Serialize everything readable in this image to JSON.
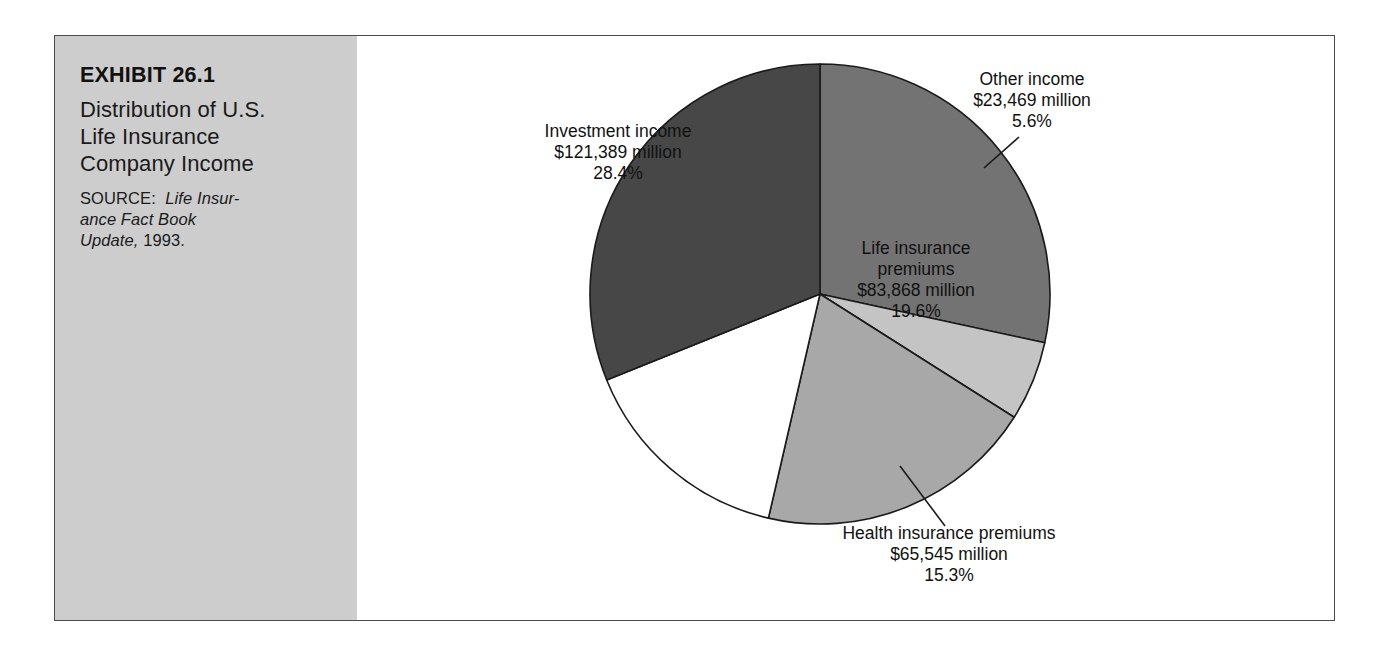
{
  "exhibit": {
    "number": "EXHIBIT 26.1",
    "title": "Distribution of U.S. Life Insurance Company Income",
    "title_lines": [
      "Distribution of U.S.",
      "Life Insurance",
      "Company Income"
    ],
    "source_label": "SOURCE:",
    "source_italic": "Life Insurance Fact Book Update,",
    "source_year": "1993.",
    "source_lines": [
      "SOURCE: Life Insur-",
      "ance Fact Book",
      "Update, 1993."
    ],
    "panel_color": "#cdcdcd",
    "border_color": "#4a4a4a"
  },
  "chart_data": {
    "type": "pie",
    "title": "Distribution of U.S. Life Insurance Company Income",
    "xlabel": "",
    "ylabel": "",
    "legend_position": "none",
    "grid": false,
    "units": "millions of U.S. dollars",
    "categories": [
      "Annuity plans",
      "Investment income",
      "Life insurance premiums",
      "Health insurance premiums",
      "Other income"
    ],
    "values": [
      132645,
      121389,
      83868,
      65545,
      23469
    ],
    "percents": [
      31.1,
      28.4,
      19.6,
      15.3,
      5.6
    ],
    "slices": [
      {
        "name": "investment-income",
        "label": "Investment income",
        "amount": "$121,389 million",
        "percent": "28.4%",
        "value": 121389,
        "pct": 28.4,
        "color": "#737373",
        "text_color": "#111111",
        "label_x": 261,
        "label_y": 92,
        "callout": false
      },
      {
        "name": "other-income",
        "label": "Other income",
        "amount": "$23,469 million",
        "percent": "5.6%",
        "value": 23469,
        "pct": 5.6,
        "color": "#c4c4c4",
        "text_color": "#111111",
        "label_x": 646,
        "label_y": 43,
        "callout": true
      },
      {
        "name": "life-insurance-premiums",
        "label": "Life insurance",
        "label2": "premiums",
        "amount": "$83,868 million",
        "percent": "19.6%",
        "value": 83868,
        "pct": 19.6,
        "color": "#a8a8a8",
        "text_color": "#111111",
        "label_x": 558,
        "label_y": 208,
        "callout": false
      },
      {
        "name": "health-insurance-premiums",
        "label": "Health insurance premiums",
        "amount": "$65,545 million",
        "percent": "15.3%",
        "value": 65545,
        "pct": 15.3,
        "color": "#ffffff",
        "text_color": "#111111",
        "label_x": 490,
        "label_y": 493,
        "callout": true
      },
      {
        "name": "annuity-plans",
        "label": "Annuity plans",
        "amount": "$132,645",
        "percent": "31.1%",
        "value": 132645,
        "pct": 31.1,
        "color": "#474747",
        "text_color": "#ffffff",
        "label_x": 150,
        "label_y": 283,
        "callout": false
      }
    ],
    "geometry": {
      "center_x": 463,
      "center_y": 258,
      "radius": 230,
      "start_angle_deg": -90
    }
  }
}
